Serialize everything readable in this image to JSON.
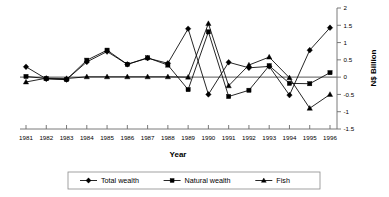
{
  "chart_data": {
    "type": "line",
    "title": "",
    "xlabel": "Year",
    "ylabel": "N$ Billion",
    "categories": [
      "1981",
      "1982",
      "1983",
      "1984",
      "1985",
      "1986",
      "1987",
      "1988",
      "1989",
      "1990",
      "1991",
      "1992",
      "1993",
      "1994",
      "1995",
      "1996"
    ],
    "x": [
      1981,
      1982,
      1983,
      1984,
      1985,
      1986,
      1987,
      1988,
      1989,
      1990,
      1991,
      1992,
      1993,
      1994,
      1995,
      1996
    ],
    "ylim": [
      -1.5,
      2
    ],
    "yticks": [
      2,
      1.5,
      1,
      0.5,
      0,
      -0.5,
      -1,
      -1.5
    ],
    "ytick_labels": [
      "2",
      "1.5",
      "1",
      "0.5",
      "0",
      "-0.5",
      "-1",
      "-1.5"
    ],
    "grid": false,
    "legend_position": "bottom",
    "y_axis_side": "right",
    "series": [
      {
        "name": "Total wealth",
        "marker": "diamond",
        "values": [
          0.3,
          -0.05,
          -0.07,
          0.44,
          0.74,
          0.37,
          0.55,
          0.4,
          1.4,
          -0.5,
          0.43,
          0.27,
          0.31,
          -0.52,
          0.78,
          1.43
        ]
      },
      {
        "name": "Natural wealth",
        "marker": "square",
        "values": [
          0.02,
          -0.04,
          -0.07,
          0.49,
          0.78,
          0.37,
          0.56,
          0.35,
          -0.36,
          1.31,
          -0.56,
          -0.38,
          0.33,
          -0.18,
          -0.19,
          0.13
        ]
      },
      {
        "name": "Fish",
        "marker": "triangle",
        "values": [
          -0.14,
          -0.03,
          -0.04,
          0.01,
          0.01,
          0.01,
          0.01,
          0.01,
          0.0,
          1.55,
          -0.25,
          0.35,
          0.58,
          -0.02,
          -0.9,
          -0.5
        ]
      }
    ]
  },
  "legend": {
    "items": [
      {
        "label": "Total wealth",
        "marker": "diamond"
      },
      {
        "label": "Natural wealth",
        "marker": "square"
      },
      {
        "label": "Fish",
        "marker": "triangle"
      }
    ]
  },
  "axes": {
    "x_title": "Year",
    "y_title": "N$ Billion"
  }
}
